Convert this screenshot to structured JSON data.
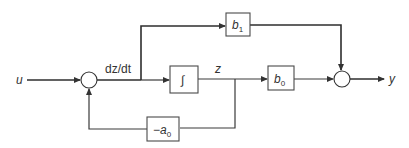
{
  "diagram": {
    "type": "block-diagram",
    "colors": {
      "line": "#333333",
      "background": "#ffffff"
    },
    "signals": {
      "input": "u",
      "derivative": "dz/dt",
      "state": "z",
      "output": "y"
    },
    "blocks": {
      "integrator": {
        "symbol": "∫"
      },
      "b1": {
        "base": "b",
        "sub": "1"
      },
      "b0": {
        "base": "b",
        "sub": "0"
      },
      "feedback": {
        "prefix": "−",
        "base": "a",
        "sub": "0"
      }
    },
    "summing_junctions": [
      "sum-input",
      "sum-output"
    ],
    "connections": [
      "u → sum-input",
      "sum-input → dz/dt → integrator",
      "dz/dt → b1 → sum-output",
      "integrator → z → b0 → sum-output",
      "z → −a0 → sum-input",
      "sum-output → y"
    ]
  }
}
